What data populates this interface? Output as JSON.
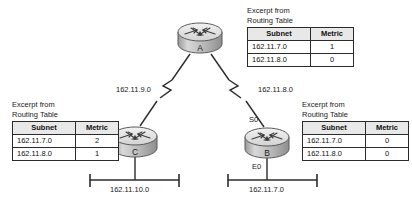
{
  "diagram": {
    "caption_text": "Excerpt from\nRouting Table",
    "columns": [
      "Subnet",
      "Metric"
    ]
  },
  "routers": [
    {
      "id": "router-a",
      "label": "A"
    },
    {
      "id": "router-c",
      "label": "C"
    },
    {
      "id": "router-b",
      "label": "B"
    }
  ],
  "interfaces": [
    {
      "id": "iface-s0",
      "label": "S0"
    },
    {
      "id": "iface-e0",
      "label": "E0"
    }
  ],
  "links": [
    {
      "id": "link-a-c",
      "label": "162.11.9.0"
    },
    {
      "id": "link-a-b",
      "label": "162.11.8.0"
    }
  ],
  "lans": [
    {
      "id": "lan-c",
      "label": "162.11.10.0"
    },
    {
      "id": "lan-b",
      "label": "162.11.7.0"
    }
  ],
  "tables": {
    "router_a": {
      "caption": "Excerpt from\nRouting Table",
      "headers": [
        "Subnet",
        "Metric"
      ],
      "rows": [
        {
          "subnet": "162.11.7.0",
          "metric": "1"
        },
        {
          "subnet": "162.11.8.0",
          "metric": "0"
        }
      ]
    },
    "router_c": {
      "caption": "Excerpt from\nRouting Table",
      "headers": [
        "Subnet",
        "Metric"
      ],
      "rows": [
        {
          "subnet": "162.11.7.0",
          "metric": "2"
        },
        {
          "subnet": "162.11.8.0",
          "metric": "1"
        }
      ]
    },
    "router_b": {
      "caption": "Excerpt from\nRouting Table",
      "headers": [
        "Subnet",
        "Metric"
      ],
      "rows": [
        {
          "subnet": "162.11.7.0",
          "metric": "0"
        },
        {
          "subnet": "162.11.8.0",
          "metric": "0"
        }
      ]
    }
  },
  "colors": {
    "line": "#2b2b2b",
    "text": "#1a1a1a",
    "table_header_bg": "#e8e8e8",
    "router_body": "#c9c9c9"
  }
}
